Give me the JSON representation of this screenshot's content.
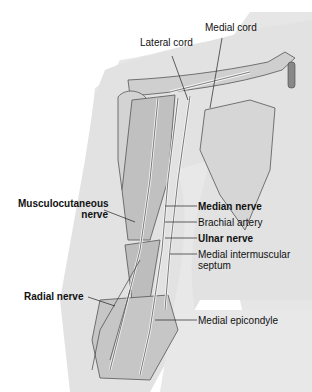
{
  "diagram": {
    "labels": {
      "medial_cord": "Medial cord",
      "lateral_cord": "Lateral cord",
      "musculocutaneous_1": "Musculocutaneous",
      "musculocutaneous_2": "nerve",
      "radial_nerve": "Radial nerve",
      "median_nerve": "Median nerve",
      "brachial_artery": "Brachial artery",
      "ulnar_nerve": "Ulnar nerve",
      "medial_intermuscular_1": "Medial intermuscular",
      "medial_intermuscular_2": "septum",
      "medial_epicondyle": "Medial epicondyle"
    },
    "colors": {
      "skin": "#e4e4e4",
      "bone": "#d2d2d2",
      "muscle": "#b9b9b9",
      "nerve": "#f4f4f4",
      "outline": "#444444",
      "leader": "#222222"
    }
  }
}
